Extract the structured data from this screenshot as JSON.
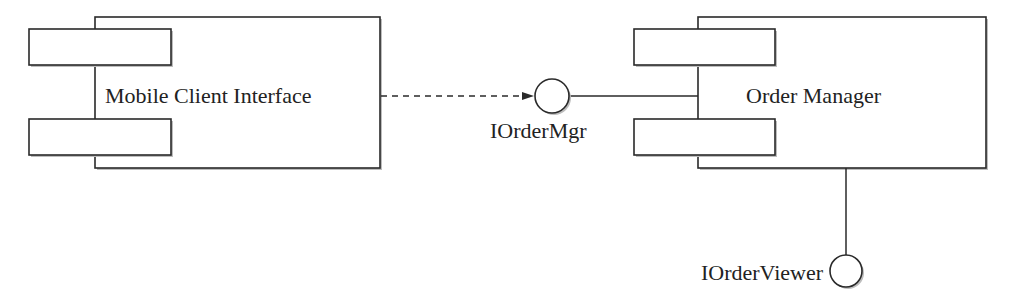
{
  "diagram": {
    "type": "uml-component",
    "components": [
      {
        "id": "mobile",
        "label": "Mobile Client Interface"
      },
      {
        "id": "order",
        "label": "Order Manager"
      }
    ],
    "interfaces": [
      {
        "id": "iordermgr",
        "label": "IOrderMgr"
      },
      {
        "id": "iorderviewer",
        "label": "IOrderViewer"
      }
    ],
    "connections": [
      {
        "from": "Mobile Client Interface",
        "to": "IOrderMgr",
        "style": "dashed-dependency"
      },
      {
        "from": "Order Manager",
        "to": "IOrderMgr",
        "style": "solid-provided"
      },
      {
        "from": "Order Manager",
        "to": "IOrderViewer",
        "style": "solid-provided"
      }
    ],
    "colors": {
      "line": "#2a2a2a",
      "fill": "#ffffff",
      "text": "#222222"
    }
  }
}
